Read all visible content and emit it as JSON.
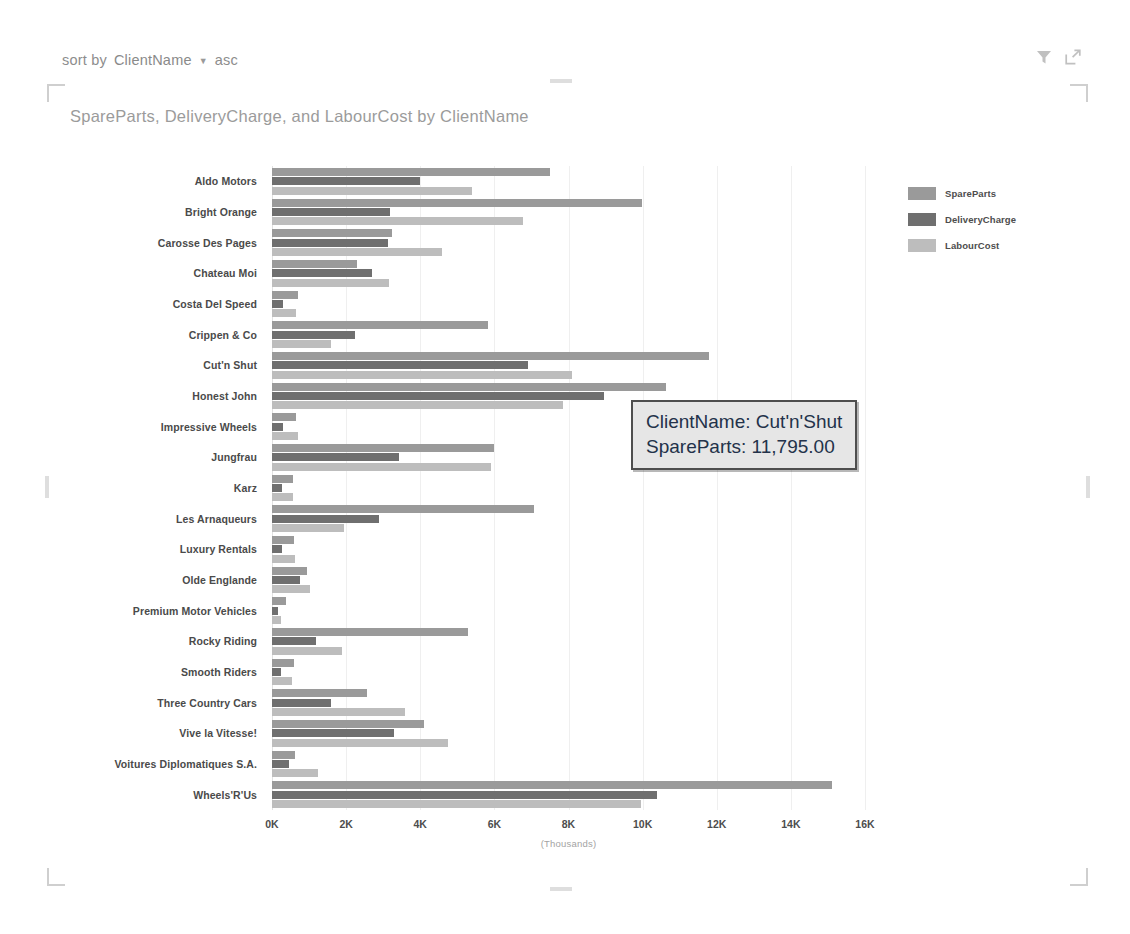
{
  "sort_bar": {
    "label": "sort by",
    "field": "ClientName",
    "caret": "chevron-down-icon",
    "direction": "asc"
  },
  "header_icons": [
    {
      "name": "filter-icon",
      "label": "Filters"
    },
    {
      "name": "focus-mode-icon",
      "label": "Focus mode"
    }
  ],
  "chart_title": "SpareParts, DeliveryCharge, and LabourCost by ClientName",
  "legend": {
    "position": "right",
    "items": [
      {
        "label": "SpareParts",
        "color": "#9a9a9a"
      },
      {
        "label": "DeliveryCharge",
        "color": "#6f6f6f"
      },
      {
        "label": "LabourCost",
        "color": "#bdbdbd"
      }
    ]
  },
  "tooltip": {
    "lines": [
      "ClientName: Cut'n'Shut",
      "SpareParts: 11,795.00"
    ]
  },
  "chart_data": {
    "type": "bar",
    "orientation": "horizontal",
    "title": "SpareParts, DeliveryCharge, and LabourCost by ClientName",
    "xlabel": "(Thousands)",
    "ylabel": "",
    "xlim": [
      0,
      16000
    ],
    "xticks": [
      0,
      2000,
      4000,
      6000,
      8000,
      10000,
      12000,
      14000,
      16000
    ],
    "xtick_labels": [
      "0K",
      "2K",
      "4K",
      "6K",
      "8K",
      "10K",
      "12K",
      "14K",
      "16K"
    ],
    "grid": true,
    "grid_axis": "x",
    "legend": [
      "SpareParts",
      "DeliveryCharge",
      "LabourCost"
    ],
    "categories": [
      "Aldo Motors",
      "Bright Orange",
      "Carosse Des Pages",
      "Chateau Moi",
      "Costa Del Speed",
      "Crippen & Co",
      "Cut'n Shut",
      "Honest John",
      "Impressive Wheels",
      "Jungfrau",
      "Karz",
      "Les Arnaqueurs",
      "Luxury Rentals",
      "Olde Englande",
      "Premium Motor Vehicles",
      "Rocky Riding",
      "Smooth Riders",
      "Three Country Cars",
      "Vive la Vitesse!",
      "Voitures Diplomatiques S.A.",
      "Wheels'R'Us"
    ],
    "series": [
      {
        "name": "SpareParts",
        "color": "#9a9a9a",
        "values": [
          7500,
          9980,
          3250,
          2300,
          700,
          5840,
          11795,
          10620,
          650,
          5980,
          580,
          7060,
          600,
          950,
          380,
          5300,
          600,
          2550,
          4100,
          620,
          15100
        ]
      },
      {
        "name": "DeliveryCharge",
        "color": "#6f6f6f",
        "values": [
          4000,
          3180,
          3130,
          2700,
          300,
          2250,
          6900,
          8950,
          300,
          3430,
          280,
          2880,
          280,
          750,
          150,
          1200,
          230,
          1580,
          3300,
          460,
          10380
        ]
      },
      {
        "name": "LabourCost",
        "color": "#bdbdbd",
        "values": [
          5400,
          6780,
          4600,
          3150,
          650,
          1600,
          8100,
          7860,
          700,
          5920,
          570,
          1950,
          620,
          1020,
          230,
          1900,
          530,
          3580,
          4760,
          1250,
          9960
        ]
      }
    ]
  }
}
